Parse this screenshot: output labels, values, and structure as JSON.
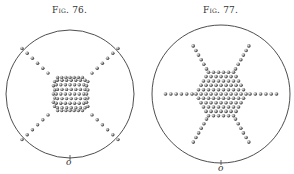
{
  "figures": [
    {
      "caption": "Fig. 76.",
      "pattern": "four-armed cross (square center with 4 diagonal arms)",
      "arms": 4,
      "bottom_mark": "o"
    },
    {
      "caption": "Fig. 77.",
      "pattern": "six-armed star (hexagonal center with 6 radial arms)",
      "arms": 6,
      "bottom_mark": "o"
    }
  ],
  "colors": {
    "line": "#3a3a3a",
    "dot": "#555555",
    "background": "#ffffff"
  }
}
